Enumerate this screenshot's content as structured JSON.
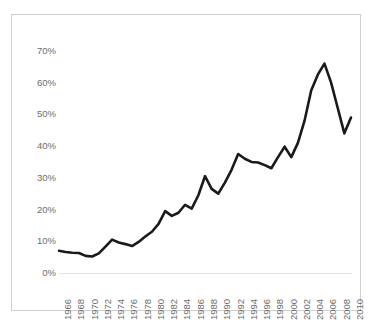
{
  "chart_data": {
    "type": "line",
    "title": "",
    "subtitle": "",
    "xlabel": "",
    "ylabel": "",
    "legend": [],
    "legend_position": "none",
    "grid": false,
    "line_color": "#1a1a1a",
    "axis_label_color": "#6c6c6c",
    "border_color": "#cfcfcf",
    "background_color": "#ffffff",
    "ylim": [
      0,
      75
    ],
    "ytick_values": [
      0,
      10,
      20,
      30,
      40,
      50,
      60,
      70
    ],
    "ytick_labels": [
      "0%",
      "10%",
      "20%",
      "30%",
      "40%",
      "50%",
      "60%",
      "70%"
    ],
    "xlim": [
      1966,
      2010
    ],
    "xtick_labels": [
      "1966",
      "1968",
      "1970",
      "1972",
      "1974",
      "1976",
      "1978",
      "1980",
      "1982",
      "1984",
      "1986",
      "1988",
      "1990",
      "1992",
      "1994",
      "1996",
      "1998",
      "2000",
      "2002",
      "2004",
      "2006",
      "2008",
      "2010"
    ],
    "x": [
      1966,
      1967,
      1968,
      1969,
      1970,
      1971,
      1972,
      1973,
      1974,
      1975,
      1976,
      1977,
      1978,
      1979,
      1980,
      1981,
      1982,
      1983,
      1984,
      1985,
      1986,
      1987,
      1988,
      1989,
      1990,
      1991,
      1992,
      1993,
      1994,
      1995,
      1996,
      1997,
      1998,
      1999,
      2000,
      2001,
      2002,
      2003,
      2004,
      2005,
      2006,
      2007,
      2008,
      2009,
      2010
    ],
    "values": [
      7.0,
      6.6,
      6.4,
      6.3,
      5.4,
      5.2,
      6.2,
      8.3,
      10.5,
      9.6,
      9.1,
      8.5,
      9.8,
      11.5,
      13.0,
      15.5,
      19.5,
      18.0,
      19.0,
      21.5,
      20.3,
      24.5,
      30.5,
      26.5,
      25.0,
      28.5,
      32.5,
      37.5,
      36.0,
      35.0,
      34.8,
      34.0,
      33.0,
      36.5,
      39.8,
      36.5,
      41.0,
      48.0,
      57.5,
      62.5,
      66.0,
      60.0,
      52.0,
      44.0,
      49.0
    ],
    "value_unit": "%"
  }
}
